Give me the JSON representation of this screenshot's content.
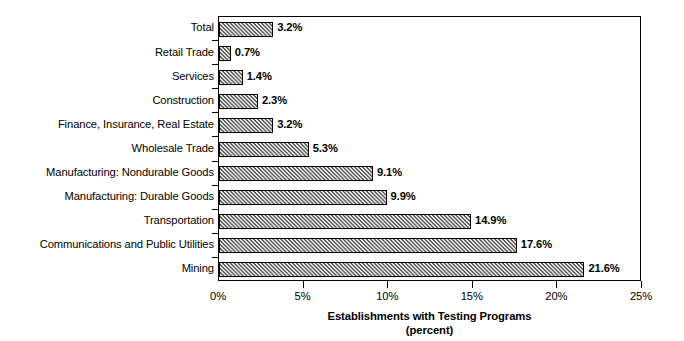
{
  "chart_data": {
    "type": "bar",
    "orientation": "horizontal",
    "title": "",
    "xlabel": "Establishments with Testing Programs",
    "xlabel_line2": "(percent)",
    "ylabel": "",
    "xlim": [
      0,
      25
    ],
    "grid": false,
    "legend": "none",
    "xtick_labels": [
      "0%",
      "5%",
      "10%",
      "15%",
      "20%",
      "25%"
    ],
    "xtick_values": [
      0,
      5,
      10,
      15,
      20,
      25
    ],
    "categories": [
      "Total",
      "Retail Trade",
      "Services",
      "Construction",
      "Finance, Insurance, Real Estate",
      "Wholesale Trade",
      "Manufacturing: Nondurable Goods",
      "Manufacturing: Durable Goods",
      "Transportation",
      "Communications and Public Utilities",
      "Mining"
    ],
    "values": [
      3.2,
      0.7,
      1.4,
      2.3,
      3.2,
      5.3,
      9.1,
      9.9,
      14.9,
      17.6,
      21.6
    ],
    "value_labels": [
      "3.2%",
      "0.7%",
      "1.4%",
      "2.3%",
      "3.2%",
      "5.3%",
      "9.1%",
      "9.9%",
      "14.9%",
      "17.6%",
      "21.6%"
    ],
    "bar_fill": "#b9b9b9",
    "bar_pattern": "diagonal-hatch",
    "bar_edge_color": "#000000",
    "axis_color": "#000000",
    "background": "#ffffff"
  }
}
